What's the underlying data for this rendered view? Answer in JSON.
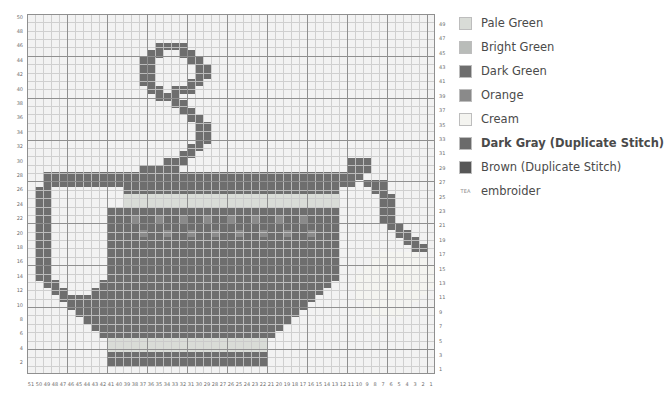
{
  "legend": {
    "items": [
      {
        "label": "Pale Green",
        "color": "#d9dcd7",
        "bold": false,
        "symbol": ""
      },
      {
        "label": "Bright Green",
        "color": "#b9bcb9",
        "bold": false,
        "symbol": ""
      },
      {
        "label": "Dark Green",
        "color": "#6e6e6e",
        "bold": false,
        "symbol": ""
      },
      {
        "label": "Orange",
        "color": "#8a8a8a",
        "bold": false,
        "symbol": ""
      },
      {
        "label": "Cream",
        "color": "#f4f4f0",
        "bold": false,
        "symbol": ""
      },
      {
        "label": "Dark Gray (Duplicate Stitch)",
        "color": "#6b6b6b",
        "bold": true,
        "symbol": ""
      },
      {
        "label": "Brown (Duplicate Stitch)",
        "color": "#575757",
        "bold": false,
        "symbol": ""
      },
      {
        "label": "embroider",
        "color": "",
        "bold": false,
        "symbol": "TEA"
      }
    ]
  },
  "chart_data": {
    "type": "heatmap",
    "title": "",
    "xlabel": "",
    "ylabel": "",
    "columns": 51,
    "rows": 43,
    "col_labels": [
      51,
      50,
      49,
      48,
      47,
      46,
      45,
      44,
      43,
      42,
      41,
      40,
      39,
      38,
      37,
      36,
      35,
      34,
      33,
      32,
      31,
      30,
      29,
      28,
      27,
      26,
      25,
      24,
      23,
      22,
      21,
      20,
      19,
      18,
      17,
      16,
      15,
      14,
      13,
      12,
      11,
      10,
      9,
      8,
      7,
      6,
      5,
      4,
      3,
      2,
      1
    ],
    "row_labels_left": [
      42,
      40,
      38,
      36,
      34,
      32,
      30,
      28,
      26,
      24,
      22,
      20,
      18,
      16,
      14,
      12,
      10,
      8,
      6,
      4,
      2
    ],
    "row_labels_right": [
      43,
      41,
      39,
      37,
      35,
      33,
      31,
      29,
      27,
      25,
      23,
      21,
      19,
      17,
      15,
      13,
      11,
      9,
      7,
      5,
      3,
      1
    ],
    "palette": {
      "0": "#eceeec",
      "1": "#d9dcd7",
      "2": "#b9bcb9",
      "3": "#6e6e6e",
      "4": "#8a8a8a",
      "5": "#f4f4f0",
      "6": "#6b6b6b",
      "7": "#575757"
    },
    "legend_position": "right",
    "grid": true,
    "note": "cells: row-major top-to-bottom, left-to-right; value = palette key",
    "cells": [
      "000000000000000000000000000000000000000000000000000",
      "000000000000000000000000000000000000000000000000000",
      "000000000000000000000000000000000000000000000000000",
      "000000000000000000000000000000000000000000000000000",
      "000000000000000033330000000000000000000000000000000",
      "000000000000000330033000000000000000000000000000000",
      "000000000000003300003300000000000000000000000000000",
      "000000000000003300000330000000000000000000000000000",
      "000000000000003300000330000000000000000000000000000",
      "000000000000003300003300000000000000000000000000000",
      "000000000000000330333000000000000000000000000000000",
      "000000000000000033300000000000000000000000000000000",
      "000000000000000000330000000000000000000000000000000",
      "000000000000000000033000000000000000000000000000000",
      "000000000000000000003300000000000000000000000000000",
      "000000000000000000000330000000000000000000000000000",
      "000000000000000000000330000000000000000000000000000",
      "000000000000000000000330000000000000000000000000000",
      "000000000000000000003300000000000000000000000000000",
      "000000000000000000033000000000000000000000000000000",
      "000000000000000003330000000000000000000033300000000",
      "000000000000003333300000000000000000000033300000000",
      "003333333333333333333333333333333333333333000000000",
      "003333333333333333333333333333333333333330333000000",
      "033000000000333333333333333333333333333000033000000",
      "033000000000111111111111111111111111111000003300000",
      "033000000000111111111111111111111111111000003300000",
      "033000000033333333333333333333333333333000003300000",
      "033000000033343343343343343343343343333000003300000",
      "033000000033333333333333333333333333333000000330000",
      "033000000033334334334334334334334334333000000033000",
      "033000000033333333333333333333333333333000000003300",
      "033000000033333333333333333333333333333000000000330",
      "033000000033333333333333333333333333333000005555500",
      "033000000033333333333333333333333333333000055555550",
      "033000000033333333333333333333333333333000555555555",
      "033000000033333333333333333333333333333005555555555",
      "003300000333333333333333333333333333330005555555555",
      "000330003333333333333333333333333333300005555555550",
      "000033333333333333333333333333333333000005555555500",
      "000003333333333333333333333333333330000000555555000",
      "000000333333333333333333333333333300000000055550000",
      "000000033333333333333333333333333000000000000000000",
      "000000003333333333333333333333330000000000000000000",
      "000000000333333333333333333333300000000000000000000",
      "000000000011111111111111111111000000000000000000000",
      "000000000011111111111111111111000000000000000000000",
      "000000000033333333333333333333000000000000000000000",
      "000000000033333333333333333333000000000000000000000",
      "000000000000000000000000000000000000000000000000000"
    ]
  }
}
